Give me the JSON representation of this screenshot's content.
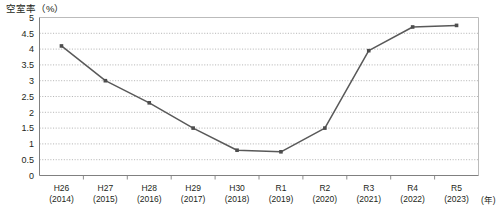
{
  "chart_data": {
    "type": "line",
    "title": "空室率（%）",
    "ylabel": "空室率（%）",
    "xlabel": "(年)",
    "x_unit_label": "(年)",
    "categories": [
      "H26\n(2014)",
      "H27\n(2015)",
      "H28\n(2016)",
      "H29\n(2017)",
      "H30\n(2018)",
      "R1\n(2019)",
      "R2\n(2020)",
      "R3\n(2021)",
      "R4\n(2022)",
      "R5\n(2023)"
    ],
    "category_era": [
      "H26",
      "H27",
      "H28",
      "H29",
      "H30",
      "R1",
      "R2",
      "R3",
      "R4",
      "R5"
    ],
    "category_year": [
      "(2014)",
      "(2015)",
      "(2016)",
      "(2017)",
      "(2018)",
      "(2019)",
      "(2020)",
      "(2021)",
      "(2022)",
      "(2023)"
    ],
    "values": [
      4.1,
      3.0,
      2.3,
      1.5,
      0.8,
      0.75,
      1.5,
      3.95,
      4.7,
      4.75
    ],
    "ylim": [
      0,
      5
    ],
    "ytick_step": 0.5,
    "yticks": [
      "0",
      "0.5",
      "1",
      "1.5",
      "2",
      "2.5",
      "3",
      "3.5",
      "4",
      "4.5",
      "5"
    ],
    "grid": true,
    "legend": "none",
    "series_color": "#595959",
    "marker": "square",
    "marker_color": "#4d4d4d"
  }
}
